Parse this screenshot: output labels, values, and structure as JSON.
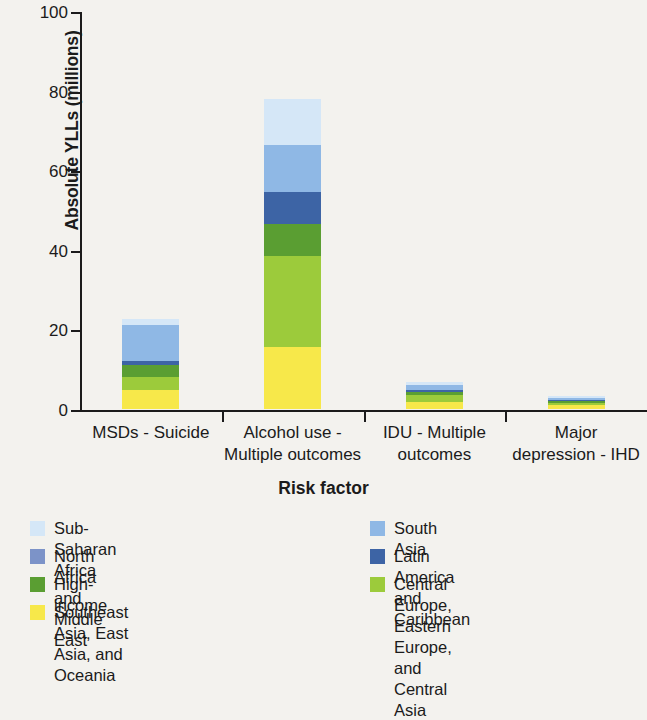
{
  "chart_data": {
    "type": "bar",
    "stacked": true,
    "title": "",
    "xlabel": "Risk factor",
    "ylabel": "Absolute YLLs (millions)",
    "ylim": [
      0,
      100
    ],
    "yticks": [
      0,
      20,
      40,
      60,
      80,
      100
    ],
    "grid": false,
    "legend_position": "bottom",
    "categories": [
      "MSDs - Suicide",
      "Alcohol use -\nMultiple outcomes",
      "IDU - Multiple\noutcomes",
      "Major\ndepression - IHD"
    ],
    "category_lines": [
      [
        "MSDs - Suicide",
        ""
      ],
      [
        "Alcohol use -",
        "Multiple outcomes"
      ],
      [
        "IDU - Multiple",
        "outcomes"
      ],
      [
        "Major",
        "depression - IHD"
      ]
    ],
    "series": [
      {
        "name": "Southeast Asia, East Asia, and Oceania",
        "color": "#f7e84a",
        "values": [
          4.8,
          15.5,
          1.8,
          0.9
        ]
      },
      {
        "name": "Central Europe, Eastern Europe, and Central Asia",
        "color": "#9ccb3b",
        "values": [
          3.2,
          23.0,
          1.6,
          0.7
        ]
      },
      {
        "name": "High-income",
        "color": "#5a9e32",
        "values": [
          3.0,
          8.0,
          1.0,
          0.5
        ]
      },
      {
        "name": "Latin America and Caribbean",
        "color": "#3d64a5",
        "values": [
          1.0,
          8.0,
          0.5,
          0.2
        ]
      },
      {
        "name": "South Asia",
        "color": "#8fb8e5",
        "values": [
          9.0,
          11.8,
          1.2,
          0.6
        ]
      },
      {
        "name": "Sub-Saharan Africa",
        "color": "#d5e7f7",
        "values": [
          1.5,
          11.7,
          0.7,
          0.3
        ]
      }
    ],
    "totals": [
      22.5,
      78.0,
      6.8,
      3.2
    ]
  },
  "axis": {
    "y_title": "Absolute YLLs (millions)",
    "x_title": "Risk factor",
    "y_tick_labels": [
      "0",
      "20",
      "40",
      "60",
      "80",
      "100"
    ]
  },
  "legend": {
    "left_column": [
      {
        "label": "Sub-Saharan Africa",
        "color": "#d5e7f7"
      },
      {
        "label": "North Africa and Middle East",
        "color": "#7c93c8"
      },
      {
        "label": "High-income",
        "color": "#5a9e32"
      },
      {
        "label": "Southeast Asia, East Asia, and Oceania",
        "color": "#f7e84a"
      }
    ],
    "right_column": [
      {
        "label": "South Asia",
        "color": "#8fb8e5"
      },
      {
        "label": "Latin America and Caribbean",
        "color": "#3d64a5"
      },
      {
        "label": "Central Europe, Eastern Europe,\nand Central Asia",
        "color": "#9ccb3b"
      }
    ]
  }
}
